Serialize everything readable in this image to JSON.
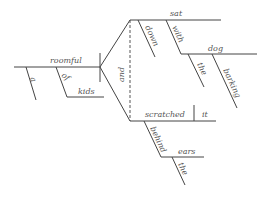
{
  "diagram": {
    "type": "sentence-diagram",
    "words": {
      "subject": "roomful",
      "subject_article": "a",
      "subject_prep": "of",
      "subject_prep_object": "kids",
      "conjunction": "and",
      "verb1": "sat",
      "verb1_adverb": "down",
      "verb1_prep": "with",
      "verb1_prep_object": "dog",
      "dog_article": "the",
      "dog_modifier": "barking",
      "verb2": "scratched",
      "verb2_object": "it",
      "verb2_prep": "behind",
      "verb2_prep_object": "ears",
      "ears_article": "the"
    },
    "line_color": "#444444"
  }
}
